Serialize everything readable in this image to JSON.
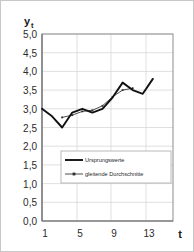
{
  "figure": {
    "background_color": "#ffffff",
    "border_color": "#c8c8c8"
  },
  "chart_data": {
    "type": "line",
    "title": "",
    "xlabel": "t",
    "ylabel": "y",
    "ylabel_subscript": "t",
    "xlim": [
      1,
      14
    ],
    "ylim": [
      0.0,
      5.0
    ],
    "grid": true,
    "legend_position": "inside-lower-center",
    "y_ticks": [
      0.0,
      0.5,
      1.0,
      1.5,
      2.0,
      2.5,
      3.0,
      3.5,
      4.0,
      4.5,
      5.0
    ],
    "y_tick_labels": [
      "0,0",
      "0,5",
      "1,0",
      "1,5",
      "2,0",
      "2,5",
      "3,0",
      "3,5",
      "4,0",
      "4,5",
      "5,0"
    ],
    "x_ticks": [
      1,
      5,
      9,
      13
    ],
    "x_tick_labels": [
      "1",
      "5",
      "9",
      "13"
    ],
    "x_gridlines": [
      1,
      5,
      9,
      13
    ],
    "series": [
      {
        "name": "Ursprungswerte",
        "style": "thick-solid",
        "color": "#111111",
        "x": [
          1,
          2,
          3,
          4,
          5,
          6,
          7,
          8,
          9,
          10,
          11,
          12
        ],
        "values": [
          3.0,
          2.8,
          2.5,
          2.9,
          3.0,
          2.9,
          3.0,
          3.3,
          3.7,
          3.5,
          3.4,
          3.8
        ]
      },
      {
        "name": "gleitende Durchschnitte",
        "style": "thin-solid",
        "color": "#2e2e2e",
        "x": [
          3,
          4,
          5,
          6,
          7,
          8,
          9,
          10
        ],
        "values": [
          2.77,
          2.83,
          2.93,
          2.96,
          3.08,
          3.32,
          3.5,
          3.55
        ]
      }
    ],
    "legend_entries": [
      {
        "label": "Ursprungswerte",
        "style": "thick-solid"
      },
      {
        "label": "gleitende Durchschnitte",
        "style": "thin-solid"
      }
    ]
  }
}
